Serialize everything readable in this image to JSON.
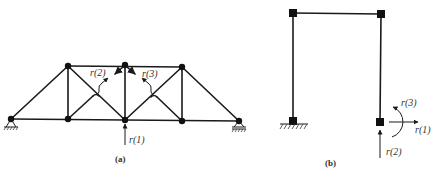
{
  "figure_a": {
    "caption": "(a)",
    "type": "truss",
    "labels": {
      "r1": "r(1)",
      "r2": "r(2)",
      "r3": "r(3)"
    }
  },
  "figure_b": {
    "caption": "(b)",
    "type": "portal-frame",
    "labels": {
      "r1": "r(1)",
      "r2": "r(2)",
      "r3": "r(3)"
    }
  },
  "colors": {
    "line": "#1a1a1a",
    "text": "#333333",
    "background": "#ffffff"
  }
}
